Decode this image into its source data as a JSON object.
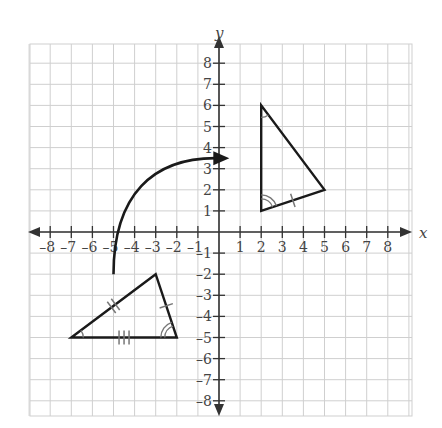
{
  "diagram": {
    "type": "coordinate-plane-transformation",
    "axes": {
      "x_label": "x",
      "y_label": "y",
      "x_range": [
        -8,
        8
      ],
      "y_range": [
        -8,
        8
      ],
      "x_ticks": [
        "–8",
        "–7",
        "–6",
        "–5",
        "–4",
        "–3",
        "–2",
        "–1",
        "1",
        "2",
        "3",
        "4",
        "5",
        "6",
        "7",
        "8"
      ],
      "y_ticks": [
        "8",
        "7",
        "6",
        "5",
        "4",
        "3",
        "2",
        "1",
        "–1",
        "–2",
        "–3",
        "–4",
        "–5",
        "–6",
        "–7",
        "–8"
      ]
    },
    "grid": {
      "spacing_units": 1,
      "color": "#cfcfcf"
    },
    "preimage_triangle": {
      "label": "pre-image triangle",
      "vertices": [
        [
          -7,
          -5
        ],
        [
          -3,
          -2
        ],
        [
          -2,
          -5
        ]
      ],
      "angle_marks": [
        {
          "vertex": [
            -7,
            -5
          ],
          "arcs": 1
        },
        {
          "vertex": [
            -2,
            -5
          ],
          "arcs": 2
        }
      ],
      "side_marks": [
        {
          "from": [
            -7,
            -5
          ],
          "to": [
            -3,
            -2
          ],
          "ticks": 2
        },
        {
          "from": [
            -3,
            -2
          ],
          "to": [
            -2,
            -5
          ],
          "ticks": 1
        },
        {
          "from": [
            -7,
            -5
          ],
          "to": [
            -2,
            -5
          ],
          "ticks": 3
        }
      ]
    },
    "image_triangle": {
      "label": "image triangle",
      "vertices": [
        [
          2,
          6
        ],
        [
          2,
          1
        ],
        [
          5,
          2
        ]
      ],
      "angle_marks": [
        {
          "vertex": [
            2,
            6
          ],
          "arcs": 1
        },
        {
          "vertex": [
            2,
            1
          ],
          "arcs": 2
        }
      ],
      "side_marks": [
        {
          "from": [
            2,
            1
          ],
          "to": [
            5,
            2
          ],
          "ticks": 1
        }
      ]
    },
    "rotation_arrow": {
      "label": "rotation arrow",
      "start": [
        -5,
        -2
      ],
      "end": [
        0.3,
        3.5
      ],
      "direction": "clockwise"
    },
    "colors": {
      "lines": "#1a1a1a",
      "axis": "#333333",
      "grid": "#cfcfcf",
      "marks": "#777777"
    }
  }
}
